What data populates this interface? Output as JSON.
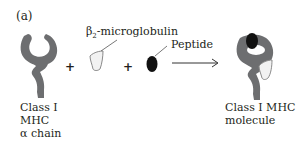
{
  "panel_label": "(a)",
  "labels": {
    "alpha_chain": [
      "Class I",
      "MHC",
      "α chain"
    ],
    "b2m_prefix": "β",
    "b2m_sub": "2",
    "b2m_suffix": "-microglobulin",
    "peptide": "Peptide",
    "molecule": [
      "Class I MHC",
      "molecule"
    ]
  },
  "operators": {
    "plus1": "+",
    "plus2": "+"
  },
  "colors": {
    "chain": "#6d6e70",
    "peptide": "#111111",
    "b2m_fill": "#f2f2f2",
    "b2m_stroke": "#8a8a8a",
    "arrow": "#333333"
  }
}
